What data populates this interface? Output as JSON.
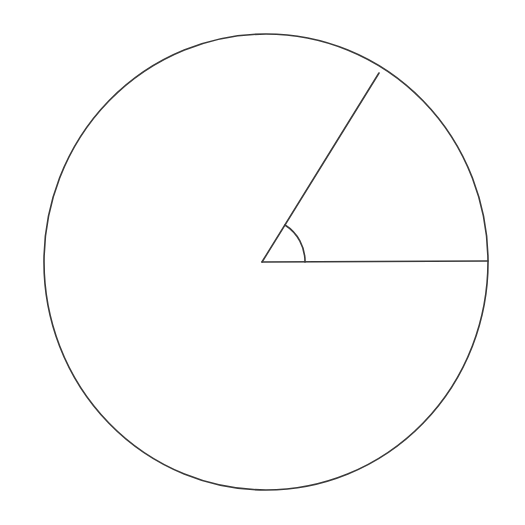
{
  "figure": {
    "background_color": "#ffffff",
    "stroke_color": "#3a3a3a",
    "canvas": {
      "width": 525,
      "height": 525
    },
    "circle": {
      "label": "circle-outline",
      "center_x": 266,
      "center_y": 262,
      "radius_x": 222,
      "radius_y": 228,
      "stroke_width": 1.6
    },
    "center_point": {
      "label": "angle-vertex",
      "x": 262,
      "y": 262
    },
    "radii": [
      {
        "label": "horizontal-radius",
        "from_x": 262,
        "from_y": 262,
        "to_x": 488,
        "to_y": 261,
        "angle_degrees": 0,
        "stroke_width": 1.6
      },
      {
        "label": "upper-radius",
        "from_x": 262,
        "from_y": 262,
        "to_x": 379,
        "to_y": 73,
        "angle_degrees": 58,
        "stroke_width": 1.6
      }
    ],
    "angle_arc": {
      "label": "angle-marker-arc",
      "radius": 43,
      "start_angle_degrees": 0,
      "end_angle_degrees": 58,
      "start_x": 305,
      "start_y": 262,
      "end_x": 285,
      "end_y": 225,
      "stroke_width": 1.6
    }
  },
  "chart_data": {
    "type": "diagram",
    "xlabel": "",
    "ylabel": "",
    "elements": [
      {
        "name": "circle",
        "center": [
          266,
          262
        ],
        "radius": 225
      },
      {
        "name": "radius-horizontal",
        "endpoint": [
          488,
          261
        ],
        "angle": 0
      },
      {
        "name": "radius-oblique",
        "endpoint": [
          379,
          73
        ],
        "angle": 58
      },
      {
        "name": "central-angle-arc",
        "radius": 43,
        "sweep": 58
      }
    ],
    "values": [
      58
    ],
    "categories": [
      "central angle (degrees)"
    ]
  }
}
